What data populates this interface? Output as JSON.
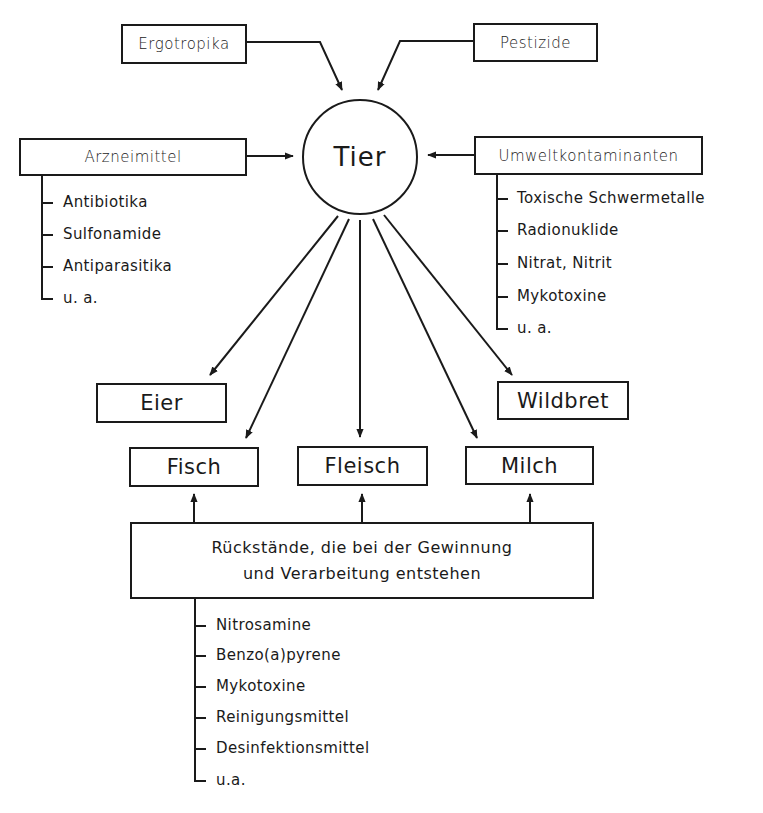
{
  "diagram": {
    "center": {
      "label": "Tier"
    },
    "inputs": {
      "ergotropika": "Ergotropika",
      "pestizide": "Pestizide",
      "arzneimittel": {
        "label": "Arzneimittel",
        "items": [
          "Antibiotika",
          "Sulfonamide",
          "Antiparasitika",
          "u. a."
        ]
      },
      "umweltkontaminanten": {
        "label": "Umweltkontaminanten",
        "items": [
          "Toxische Schwermetalle",
          "Radionuklide",
          "Nitrat, Nitrit",
          "Mykotoxine",
          "u. a."
        ]
      }
    },
    "products": {
      "eier": "Eier",
      "fisch": "Fisch",
      "fleisch": "Fleisch",
      "milch": "Milch",
      "wildbret": "Wildbret"
    },
    "processing": {
      "label_line1": "Rückstände, die bei der Gewinnung",
      "label_line2": "und Verarbeitung entstehen",
      "items": [
        "Nitrosamine",
        "Benzo(a)pyrene",
        "Mykotoxine",
        "Reinigungsmittel",
        "Desinfektionsmittel",
        "u.a."
      ]
    },
    "colors": {
      "line": "#1a1a1a",
      "background": "#ffffff"
    }
  }
}
